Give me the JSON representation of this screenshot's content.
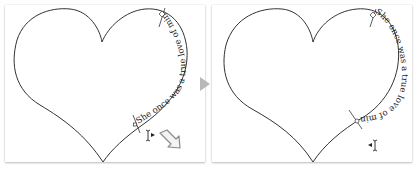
{
  "panels": [
    {
      "id": "before",
      "path_text": "She once was a true love of mine",
      "text_direction": "bottom-to-top along right lobe"
    },
    {
      "id": "after",
      "path_text": "She once was a true love of mine",
      "text_direction": "top-to-bottom along right lobe"
    }
  ],
  "transition_arrow": {
    "icon": "play-arrow-icon",
    "color": "#b8b8b8"
  },
  "colors": {
    "stroke": "#333333",
    "text": "#222222",
    "panel_bg": "#ffffff"
  }
}
